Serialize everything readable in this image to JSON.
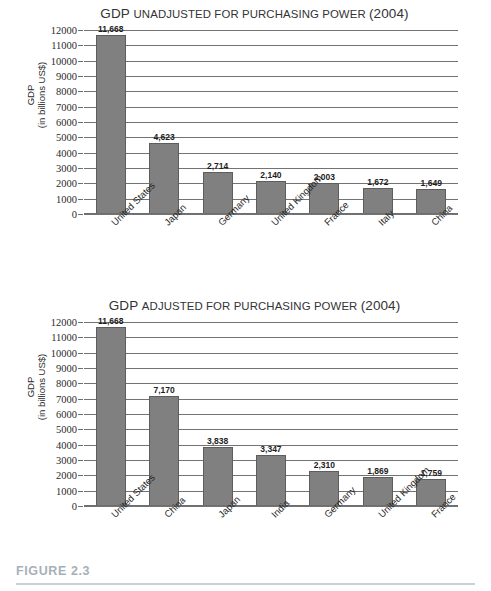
{
  "figure": {
    "caption_label": "FIGURE 2.3",
    "caption_color": "#a7b0b8",
    "rule_color": "#c9d1d7"
  },
  "style": {
    "bar_fill": "#808080",
    "bar_stroke": "#5d5d5d",
    "gridline_color": "#737373",
    "text_color": "#2b2b2b"
  },
  "charts": [
    {
      "id": "chart-1",
      "title_lead": "GDP ",
      "title_smallcaps_1": "UNADJUSTED FOR ",
      "title_smallcaps_2": "PURCHASING ",
      "title_smallcaps_3": "POWER ",
      "title_tail": "(2004)",
      "title_full": "GDP Unadjusted for Purchasing Power (2004)",
      "ylabel_line1": "GDP",
      "ylabel_line2": "(in billions US$)",
      "ticks": [
        "12000",
        "11000",
        "10000",
        "9000",
        "8000",
        "7000",
        "6000",
        "5000",
        "4000",
        "3000",
        "2000",
        "1000",
        "0"
      ],
      "bars": [
        {
          "category": "United States",
          "value": 11668,
          "label": "11,668"
        },
        {
          "category": "Japan",
          "value": 4623,
          "label": "4,623"
        },
        {
          "category": "Germany",
          "value": 2714,
          "label": "2,714"
        },
        {
          "category": "United Kingdom",
          "value": 2140,
          "label": "2,140"
        },
        {
          "category": "France",
          "value": 2003,
          "label": "2,003"
        },
        {
          "category": "Italy",
          "value": 1672,
          "label": "1,672"
        },
        {
          "category": "China",
          "value": 1649,
          "label": "1,649"
        }
      ]
    },
    {
      "id": "chart-2",
      "title_lead": "GDP ",
      "title_smallcaps_1": "ADJUSTED FOR ",
      "title_smallcaps_2": "PURCHASING ",
      "title_smallcaps_3": "POWER ",
      "title_tail": "(2004)",
      "title_full": "GDP Adjusted for Purchasing Power (2004)",
      "ylabel_line1": "GDP",
      "ylabel_line2": "(in billions US$)",
      "ticks": [
        "12000",
        "11000",
        "10000",
        "9000",
        "8000",
        "7000",
        "6000",
        "5000",
        "4000",
        "3000",
        "2000",
        "1000",
        "0"
      ],
      "bars": [
        {
          "category": "United States",
          "value": 11668,
          "label": "11,668"
        },
        {
          "category": "China",
          "value": 7170,
          "label": "7,170"
        },
        {
          "category": "Japan",
          "value": 3838,
          "label": "3,838"
        },
        {
          "category": "India",
          "value": 3347,
          "label": "3,347"
        },
        {
          "category": "Germany",
          "value": 2310,
          "label": "2,310"
        },
        {
          "category": "United Kingdom",
          "value": 1869,
          "label": "1,869"
        },
        {
          "category": "France",
          "value": 1759,
          "label": "1,759"
        }
      ]
    }
  ],
  "chart_data": [
    {
      "type": "bar",
      "title": "GDP Unadjusted for Purchasing Power (2004)",
      "xlabel": "",
      "ylabel": "GDP (in billions US$)",
      "ylim": [
        0,
        12000
      ],
      "ytick_step": 1000,
      "grid": true,
      "legend": "none",
      "categories": [
        "United States",
        "Japan",
        "Germany",
        "United Kingdom",
        "France",
        "Italy",
        "China"
      ],
      "values": [
        11668,
        4623,
        2714,
        2140,
        2003,
        1672,
        1649
      ],
      "value_labels": [
        "11,668",
        "4,623",
        "2,714",
        "2,140",
        "2,003",
        "1,672",
        "1,649"
      ]
    },
    {
      "type": "bar",
      "title": "GDP Adjusted for Purchasing Power (2004)",
      "xlabel": "",
      "ylabel": "GDP (in billions US$)",
      "ylim": [
        0,
        12000
      ],
      "ytick_step": 1000,
      "grid": true,
      "legend": "none",
      "categories": [
        "United States",
        "China",
        "Japan",
        "India",
        "Germany",
        "United Kingdom",
        "France"
      ],
      "values": [
        11668,
        7170,
        3838,
        3347,
        2310,
        1869,
        1759
      ],
      "value_labels": [
        "11,668",
        "7,170",
        "3,838",
        "3,347",
        "2,310",
        "1,869",
        "1,759"
      ]
    }
  ]
}
